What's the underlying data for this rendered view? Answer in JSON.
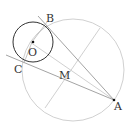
{
  "diagram": {
    "title": "",
    "points": [
      {
        "name": "B",
        "label": "B"
      },
      {
        "name": "O",
        "label": "O"
      },
      {
        "name": "C",
        "label": "C"
      },
      {
        "name": "M",
        "label": "M"
      },
      {
        "name": "A",
        "label": "A"
      }
    ],
    "elements": [
      "circle O",
      "circle M (diameter OA)",
      "tangent AB",
      "tangent AC",
      "segment OA",
      "perpendicular bisector of OA"
    ],
    "colors": {
      "main": "#333333",
      "construction": "#bbbbbb"
    }
  }
}
